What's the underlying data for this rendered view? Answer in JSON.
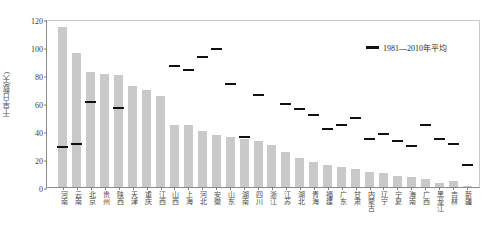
{
  "chart_data": {
    "type": "bar",
    "title": "",
    "xlabel": "",
    "ylabel": "干旱日数(天)",
    "ylim": [
      0,
      120
    ],
    "yticks": [
      0,
      20,
      40,
      60,
      80,
      100,
      120
    ],
    "grid": false,
    "legend_position": "top-right",
    "categories": [
      "河南",
      "云南",
      "北京",
      "贵州",
      "陕西",
      "天津",
      "重庆",
      "江西",
      "山西",
      "上海",
      "河北",
      "安徽",
      "山东",
      "湖南",
      "四川",
      "浙江",
      "江苏",
      "湖北",
      "青海",
      "福建",
      "广东",
      "甘肃",
      "内蒙古",
      "辽宁",
      "宁夏",
      "海南",
      "广西",
      "黑龙江",
      "吉林",
      "新疆"
    ],
    "series": [
      {
        "name": "2013年",
        "type": "bar",
        "color": "#c9c9c9",
        "values": [
          114,
          96,
          82,
          81,
          80,
          72,
          69,
          65,
          44,
          44,
          40,
          37,
          36,
          34,
          33,
          30,
          25,
          21,
          18,
          16,
          14,
          13,
          11,
          10,
          8,
          7,
          6,
          3,
          4,
          1
        ]
      },
      {
        "name": "1981—2010年平均",
        "type": "marker",
        "color": "#111111",
        "values": [
          30,
          32,
          62,
          null,
          58,
          null,
          null,
          null,
          88,
          85,
          94,
          100,
          75,
          37,
          67,
          null,
          61,
          57,
          53,
          43,
          46,
          51,
          36,
          39,
          34,
          31,
          46,
          36,
          32,
          17
        ]
      }
    ],
    "legend": [
      {
        "label": "1981—2010年平均",
        "color": "#111111"
      }
    ]
  }
}
